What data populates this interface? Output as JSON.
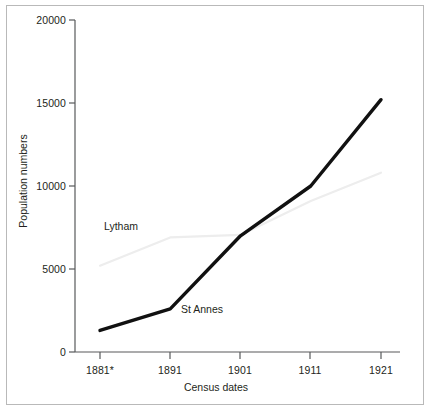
{
  "chart_data": {
    "type": "line",
    "title": "",
    "xlabel": "Census dates",
    "ylabel": "Population numbers",
    "x": [
      1881,
      1891,
      1901,
      1911,
      1921
    ],
    "xtick_labels": [
      "1881*",
      "1891",
      "1901",
      "1911",
      "1921"
    ],
    "ytick_labels": [
      "0",
      "5000",
      "10000",
      "15000",
      "20000"
    ],
    "ytick_values": [
      0,
      5000,
      10000,
      15000,
      20000
    ],
    "ylim": [
      0,
      20000
    ],
    "grid": false,
    "legend": "inline-annotations",
    "series": [
      {
        "name": "St Annes",
        "values": [
          1300,
          2600,
          7000,
          10000,
          15200
        ],
        "color": "#111111",
        "width": 3.4,
        "label_x": 1897,
        "label_y": 2300
      },
      {
        "name": "Lytham",
        "values": [
          5200,
          6900,
          7050,
          9100,
          10800
        ],
        "color": "#ededed",
        "width": 2.2,
        "label_x": 1888,
        "label_y": 7550
      }
    ],
    "axis_color": "#58595b",
    "text_color": "#231f20",
    "frame_color": "#b9b9b9",
    "background": "#ffffff"
  }
}
